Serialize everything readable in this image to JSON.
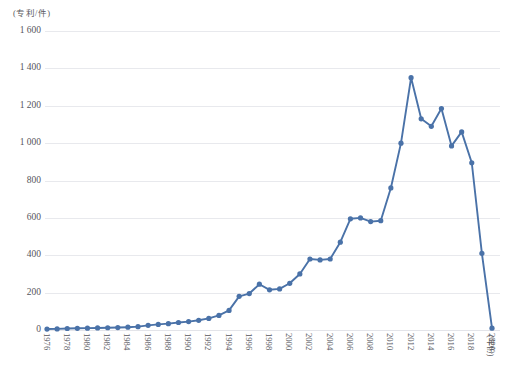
{
  "chart_data": {
    "type": "line",
    "title": "",
    "subtitle": "",
    "xlabel": "(年份)",
    "ylabel": "(专利/件)",
    "ylim": [
      0,
      1600
    ],
    "yticks": [
      0,
      200,
      400,
      600,
      800,
      1000,
      1200,
      1400,
      1600
    ],
    "ytick_labels": [
      "0",
      "200",
      "400",
      "600",
      "800",
      "1 000",
      "1 200",
      "1 400",
      "1 600"
    ],
    "grid": true,
    "legend": null,
    "legend_position": "none",
    "marker": "circle",
    "line_color": "#4a72a8",
    "marker_color": "#4a72a8",
    "x": [
      1976,
      1977,
      1978,
      1979,
      1980,
      1981,
      1982,
      1983,
      1984,
      1985,
      1986,
      1987,
      1988,
      1989,
      1990,
      1991,
      1992,
      1993,
      1994,
      1995,
      1996,
      1997,
      1998,
      1999,
      2000,
      2001,
      2002,
      2003,
      2004,
      2005,
      2006,
      2007,
      2008,
      2009,
      2010,
      2011,
      2012,
      2013,
      2014,
      2015,
      2016,
      2017,
      2018,
      2019,
      2020
    ],
    "xtick_labels": [
      "1976",
      "1978",
      "1980",
      "1982",
      "1984",
      "1986",
      "1988",
      "1990",
      "1992",
      "1994",
      "1996",
      "1998",
      "2000",
      "2002",
      "2004",
      "2006",
      "2008",
      "2010",
      "2012",
      "2014",
      "2016",
      "2018",
      "2020"
    ],
    "values": [
      5,
      6,
      8,
      9,
      10,
      11,
      12,
      13,
      15,
      18,
      25,
      30,
      34,
      40,
      45,
      52,
      62,
      78,
      105,
      180,
      195,
      245,
      215,
      220,
      250,
      300,
      380,
      375,
      380,
      470,
      595,
      600,
      580,
      585,
      760,
      1000,
      1350,
      1130,
      1090,
      1185,
      985,
      1060,
      895,
      410,
      10
    ],
    "annotations": []
  },
  "axis": {
    "y_unit_label": "(专利/件)",
    "x_unit_label": "(年份)"
  },
  "caption": ""
}
